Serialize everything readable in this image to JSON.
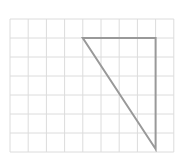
{
  "diagram": {
    "type": "grid-triangle",
    "grid": {
      "columns": 9,
      "rows": 7,
      "origin": [
        10,
        19
      ],
      "cell_width": 18.2,
      "cell_height": 19,
      "line_color": "#dcdcdc"
    },
    "triangle": {
      "vertices_grid": [
        [
          4,
          1
        ],
        [
          8,
          1
        ],
        [
          8,
          7
        ]
      ],
      "stroke_color": "#999999",
      "stroke_width": 2
    }
  }
}
